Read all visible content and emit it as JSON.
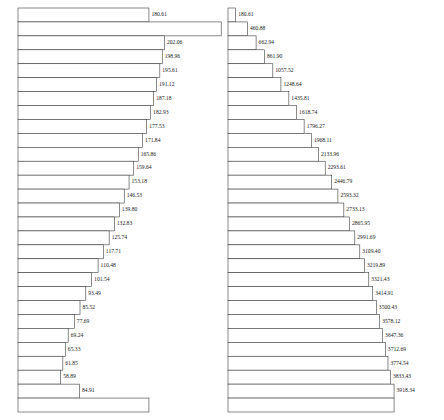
{
  "figure": {
    "title": "",
    "panels": [
      {
        "name": "incremental-bar-panel",
        "position": "left"
      },
      {
        "name": "cumulative-bar-panel",
        "position": "right"
      }
    ]
  },
  "chart_data": [
    {
      "type": "bar",
      "orientation": "horizontal",
      "name": "incremental-values",
      "title": "",
      "xlabel": "",
      "ylabel": "",
      "grid": false,
      "legend": null,
      "axis_visible": false,
      "tick_labels": [],
      "xlim": [
        0,
        300
      ],
      "categories": [
        "1",
        "2",
        "3",
        "4",
        "5",
        "6",
        "7",
        "8",
        "9",
        "10",
        "11",
        "12",
        "13",
        "14",
        "15",
        "16",
        "17",
        "18",
        "19",
        "20",
        "21",
        "22",
        "23",
        "24",
        "25",
        "26",
        "27",
        "28",
        "29"
      ],
      "values": [
        180.61,
        280.27,
        202.06,
        198.96,
        195.61,
        191.12,
        187.18,
        182.93,
        177.53,
        171.84,
        165.86,
        159.64,
        153.18,
        146.53,
        139.8,
        132.83,
        125.74,
        117.71,
        110.48,
        101.54,
        93.49,
        85.52,
        77.69,
        69.24,
        65.33,
        61.85,
        58.89,
        84.91,
        180.61
      ],
      "data_labels": [
        "180.61",
        "280.27",
        "202.06",
        "198.96",
        "195.61",
        "191.12",
        "187.18",
        "182.93",
        "177.53",
        "171.84",
        "165.86",
        "159.64",
        "153.18",
        "146.53",
        "139.80",
        "132.83",
        "125.74",
        "117.71",
        "110.48",
        "101.54",
        "93.49",
        "85.52",
        "77.69",
        "69.24",
        "65.33",
        "61.85",
        "58.89",
        "84.91",
        ""
      ]
    },
    {
      "type": "bar",
      "orientation": "horizontal",
      "name": "cumulative-values",
      "title": "",
      "xlabel": "",
      "ylabel": "",
      "grid": false,
      "legend": null,
      "axis_visible": false,
      "tick_labels": [],
      "xlim": [
        0,
        4200
      ],
      "categories": [
        "1",
        "2",
        "3",
        "4",
        "5",
        "6",
        "7",
        "8",
        "9",
        "10",
        "11",
        "12",
        "13",
        "14",
        "15",
        "16",
        "17",
        "18",
        "19",
        "20",
        "21",
        "22",
        "23",
        "24",
        "25",
        "26",
        "27",
        "28",
        "29"
      ],
      "values": [
        180.61,
        460.88,
        662.94,
        861.9,
        1057.52,
        1248.64,
        1435.81,
        1618.74,
        1796.27,
        1968.11,
        2133.96,
        2293.61,
        2446.79,
        2593.32,
        2733.13,
        2865.95,
        2991.69,
        3109.4,
        3219.89,
        3321.43,
        3414.91,
        3500.43,
        3578.12,
        3647.36,
        3712.69,
        3774.54,
        3833.43,
        3918.34,
        3918.34
      ],
      "data_labels": [
        "180.61",
        "460.88",
        "662.94",
        "861.90",
        "1057.52",
        "1248.64",
        "1435.81",
        "1618.74",
        "1796.27",
        "1968.11",
        "2133.96",
        "2293.61",
        "2446.79",
        "2593.32",
        "2733.13",
        "2865.95",
        "2991.69",
        "3109.40",
        "3219.89",
        "3321.43",
        "3414.91",
        "3500.43",
        "3578.12",
        "3647.36",
        "3712.69",
        "3774.54",
        "3833.43",
        "3918.34",
        ""
      ]
    }
  ],
  "style": {
    "bar_fill": "#ffffff",
    "bar_stroke": "#3c3c3c",
    "label_color": "#1a1a1a",
    "background": "#ffffff"
  }
}
